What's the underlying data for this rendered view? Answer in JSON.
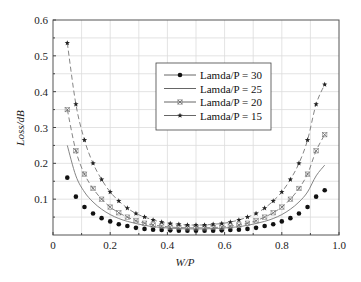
{
  "chart_data": {
    "type": "line",
    "title": "",
    "xlabel": "W/P",
    "ylabel": "Loss/dB",
    "xlim": [
      0,
      1.0
    ],
    "ylim": [
      0,
      0.6
    ],
    "xticks": [
      "0",
      "0.2",
      "0.4",
      "0.6",
      "0.8",
      "1.0"
    ],
    "yticks": [
      "0.1",
      "0.2",
      "0.3",
      "0.4",
      "0.5",
      "0.6"
    ],
    "grid": true,
    "legend_position": "upper center",
    "x": [
      0.05,
      0.08,
      0.11,
      0.14,
      0.17,
      0.2,
      0.23,
      0.26,
      0.29,
      0.32,
      0.35,
      0.38,
      0.41,
      0.44,
      0.47,
      0.5,
      0.53,
      0.56,
      0.59,
      0.62,
      0.65,
      0.68,
      0.71,
      0.74,
      0.77,
      0.8,
      0.83,
      0.86,
      0.89,
      0.92,
      0.95
    ],
    "series": [
      {
        "name": "Lamda/P = 30",
        "marker": "dot",
        "line": "none",
        "values": [
          0.16,
          0.107,
          0.078,
          0.06,
          0.047,
          0.038,
          0.03,
          0.025,
          0.02,
          0.017,
          0.015,
          0.014,
          0.013,
          0.012,
          0.012,
          0.012,
          0.012,
          0.012,
          0.013,
          0.014,
          0.015,
          0.017,
          0.02,
          0.025,
          0.03,
          0.038,
          0.047,
          0.06,
          0.078,
          0.107,
          0.125
        ]
      },
      {
        "name": "Lamda/P = 25",
        "marker": "none",
        "line": "solid",
        "values": [
          0.25,
          0.165,
          0.12,
          0.092,
          0.072,
          0.057,
          0.046,
          0.038,
          0.032,
          0.027,
          0.023,
          0.021,
          0.019,
          0.018,
          0.017,
          0.017,
          0.017,
          0.018,
          0.019,
          0.021,
          0.023,
          0.027,
          0.032,
          0.038,
          0.046,
          0.057,
          0.072,
          0.092,
          0.12,
          0.165,
          0.195
        ]
      },
      {
        "name": "Lamda/P = 20",
        "marker": "x",
        "line": "dashed",
        "values": [
          0.35,
          0.235,
          0.17,
          0.13,
          0.1,
          0.078,
          0.062,
          0.05,
          0.04,
          0.033,
          0.028,
          0.025,
          0.022,
          0.021,
          0.02,
          0.02,
          0.02,
          0.021,
          0.022,
          0.025,
          0.028,
          0.033,
          0.04,
          0.05,
          0.062,
          0.078,
          0.1,
          0.13,
          0.17,
          0.235,
          0.28
        ]
      },
      {
        "name": "Lamda/P = 15",
        "marker": "star",
        "line": "dashed",
        "values": [
          0.536,
          0.365,
          0.265,
          0.2,
          0.155,
          0.12,
          0.095,
          0.075,
          0.06,
          0.05,
          0.042,
          0.036,
          0.032,
          0.03,
          0.028,
          0.028,
          0.028,
          0.03,
          0.032,
          0.036,
          0.042,
          0.05,
          0.06,
          0.075,
          0.095,
          0.12,
          0.155,
          0.2,
          0.265,
          0.365,
          0.42
        ]
      }
    ]
  },
  "legend": {
    "items": [
      "Lamda/P = 30",
      "Lamda/P = 25",
      "Lamda/P = 20",
      "Lamda/P = 15"
    ]
  },
  "axes": {
    "x_title": "W/P",
    "y_title": "Loss/dB",
    "x_zero_label": "0"
  }
}
